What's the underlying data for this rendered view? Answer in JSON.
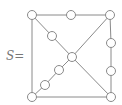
{
  "label": {
    "name": "S",
    "equals": "="
  },
  "graph": {
    "node_radius": 4.5,
    "stroke_color": "#8a8a8a",
    "fill_color": "#ffffff",
    "nodes": [
      {
        "id": "tl",
        "x": 32,
        "y": 15
      },
      {
        "id": "tm",
        "x": 71,
        "y": 15
      },
      {
        "id": "tr",
        "x": 110,
        "y": 15
      },
      {
        "id": "d1",
        "x": 52,
        "y": 36
      },
      {
        "id": "c",
        "x": 72,
        "y": 57
      },
      {
        "id": "r1",
        "x": 111,
        "y": 43
      },
      {
        "id": "r2",
        "x": 111,
        "y": 71
      },
      {
        "id": "d2",
        "x": 59,
        "y": 70
      },
      {
        "id": "d3",
        "x": 45,
        "y": 85
      },
      {
        "id": "bl",
        "x": 32,
        "y": 97
      },
      {
        "id": "br",
        "x": 111,
        "y": 97
      }
    ],
    "edges": [
      [
        "tl",
        "tm"
      ],
      [
        "tm",
        "tr"
      ],
      [
        "tl",
        "bl"
      ],
      [
        "bl",
        "br"
      ],
      [
        "tr",
        "r1"
      ],
      [
        "r1",
        "r2"
      ],
      [
        "r2",
        "br"
      ],
      [
        "tl",
        "d1"
      ],
      [
        "d1",
        "c"
      ],
      [
        "c",
        "br"
      ],
      [
        "tr",
        "c"
      ],
      [
        "c",
        "d2"
      ],
      [
        "d2",
        "d3"
      ],
      [
        "d3",
        "bl"
      ]
    ]
  }
}
